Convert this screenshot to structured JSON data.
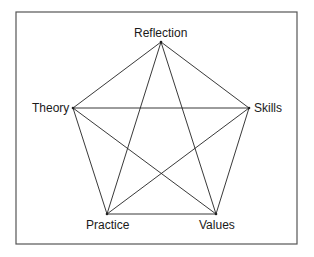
{
  "diagram": {
    "type": "pentagram",
    "frame": {
      "x": 16,
      "y": 12,
      "width": 281,
      "height": 232,
      "color": "#555555"
    },
    "line_color": "#222222",
    "nodes": [
      {
        "id": "reflection",
        "label": "Reflection",
        "x": 161,
        "y": 42
      },
      {
        "id": "skills",
        "label": "Skills",
        "x": 249,
        "y": 108
      },
      {
        "id": "values",
        "label": "Values",
        "x": 216,
        "y": 214
      },
      {
        "id": "practice",
        "label": "Practice",
        "x": 107,
        "y": 214
      },
      {
        "id": "theory",
        "label": "Theory",
        "x": 73,
        "y": 108
      }
    ],
    "edges": [
      [
        "reflection",
        "skills"
      ],
      [
        "skills",
        "values"
      ],
      [
        "values",
        "practice"
      ],
      [
        "practice",
        "theory"
      ],
      [
        "theory",
        "reflection"
      ],
      [
        "reflection",
        "values"
      ],
      [
        "reflection",
        "practice"
      ],
      [
        "theory",
        "skills"
      ],
      [
        "theory",
        "values"
      ],
      [
        "skills",
        "practice"
      ]
    ]
  }
}
